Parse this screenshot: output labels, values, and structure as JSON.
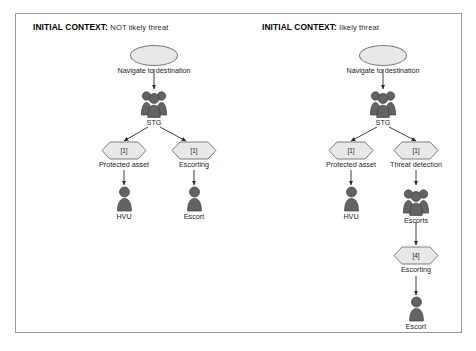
{
  "figure": {
    "panels": [
      {
        "id": "left-panel",
        "context_key": "INITIAL CONTEXT:",
        "context_value": "NOT likely threat",
        "nodes": [
          {
            "id": "l-start",
            "type": "ellipse",
            "label": "Navigate to destination",
            "count": ""
          },
          {
            "id": "l-stg",
            "type": "group",
            "label": "STG",
            "count": ""
          },
          {
            "id": "l-hex-pa",
            "type": "hexagon",
            "label": "Protected asset",
            "count": "[1]"
          },
          {
            "id": "l-hex-esc",
            "type": "hexagon",
            "label": "Escorting",
            "count": "[1]"
          },
          {
            "id": "l-hvu",
            "type": "person",
            "label": "HVU",
            "count": ""
          },
          {
            "id": "l-escort",
            "type": "person",
            "label": "Escort",
            "count": ""
          }
        ]
      },
      {
        "id": "right-panel",
        "context_key": "INITIAL CONTEXT:",
        "context_value": "likely threat",
        "nodes": [
          {
            "id": "r-start",
            "type": "ellipse",
            "label": "Navigate to destination",
            "count": ""
          },
          {
            "id": "r-stg",
            "type": "group",
            "label": "STG",
            "count": ""
          },
          {
            "id": "r-hex-pa",
            "type": "hexagon",
            "label": "Protected asset",
            "count": "[1]"
          },
          {
            "id": "r-hex-td",
            "type": "hexagon",
            "label": "Threat detection",
            "count": "[1]"
          },
          {
            "id": "r-hvu",
            "type": "person",
            "label": "HVU",
            "count": ""
          },
          {
            "id": "r-escorts",
            "type": "group",
            "label": "Escorts",
            "count": ""
          },
          {
            "id": "r-hex-esc",
            "type": "hexagon",
            "label": "Escorting",
            "count": "[4]"
          },
          {
            "id": "r-escort",
            "type": "person",
            "label": "Escort",
            "count": ""
          }
        ]
      }
    ],
    "colors": {
      "shape_fill": "#e8e8e8",
      "shape_stroke": "#7d7d7d",
      "icon_fill": "#636363",
      "icon_stroke": "#3f3f3f",
      "connector": "#2b2b2b",
      "panel_border": "#9a9a9a",
      "background": "#ffffff",
      "text": "#1a1a1a"
    }
  }
}
